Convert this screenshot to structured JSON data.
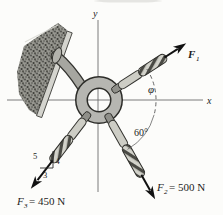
{
  "figure": {
    "type": "statics-force-diagram",
    "background": "#fcfcfa",
    "axis": {
      "x_label": "x",
      "y_label": "y"
    },
    "forces": {
      "f1": {
        "symbol": "F",
        "sub": "1",
        "eq": ""
      },
      "f2": {
        "symbol": "F",
        "sub": "2",
        "eq": "= 500 N"
      },
      "f3": {
        "symbol": "F",
        "sub": "3",
        "eq": "= 450 N"
      }
    },
    "angles": {
      "phi": "φ",
      "sixty": "60°"
    },
    "slope_triangle": {
      "hyp": "5",
      "vert": "4",
      "horiz": "3"
    },
    "geometry_notes": {
      "f2_angle_below_x_axis_deg": 60,
      "f3_slope": "3-4-5",
      "f1_angle_label": "φ above x-axis"
    },
    "colors": {
      "ink": "#1c1c1c",
      "rope_light": "#cdcdc5",
      "rope_dark": "#4a4a44",
      "ring_metal": "#b6b6b1",
      "wall": "#8d8d87",
      "plate": "#d4d4ce",
      "background": "#fcfcfa"
    }
  }
}
